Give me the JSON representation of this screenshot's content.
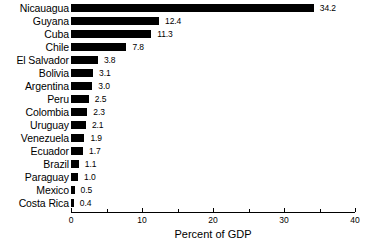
{
  "chart_data": {
    "type": "bar",
    "orientation": "horizontal",
    "title": "",
    "subtitle": "",
    "xlabel": "Percent of GDP",
    "ylabel": "",
    "xlim": [
      0,
      40
    ],
    "grid": false,
    "legend": null,
    "bar_color": "#000000",
    "background_color": "#ffffff",
    "x_major_ticks": [
      0,
      10,
      20,
      30,
      40
    ],
    "x_major_tick_labels": [
      "0",
      "10",
      "20",
      "30",
      "40"
    ],
    "x_minor_ticks": [
      5,
      15,
      25,
      35
    ],
    "categories": [
      "Nicauagua",
      "Guyana",
      "Cuba",
      "Chile",
      "El Salvador",
      "Bolivia",
      "Argentina",
      "Peru",
      "Colombia",
      "Uruguay",
      "Venezuela",
      "Ecuador",
      "Brazil",
      "Paraguay",
      "Mexico",
      "Costa Rica"
    ],
    "values": [
      34.2,
      12.4,
      11.3,
      7.8,
      3.8,
      3.1,
      3.0,
      2.5,
      2.3,
      2.1,
      1.9,
      1.7,
      1.1,
      1.0,
      0.5,
      0.4
    ],
    "value_labels": [
      "34.2",
      "12.4",
      "11.3",
      "7.8",
      "3.8",
      "3.1",
      "3.0",
      "2.5",
      "2.3",
      "2.1",
      "1.9",
      "1.7",
      "1.1",
      "1.0",
      "0.5",
      "0.4"
    ]
  },
  "axis": {
    "x_title": "Percent of GDP"
  }
}
